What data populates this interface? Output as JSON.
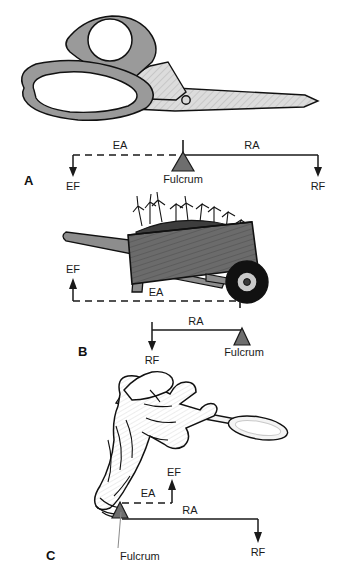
{
  "figure": {
    "background_color": "#ffffff",
    "ink_color": "#1a1a1a",
    "fulcrum_fill": "#6e6e6e",
    "handle_gray": "#9a9a9a",
    "blade_gray": "#d8d8d8",
    "tray_gray": "#6b6b6b",
    "wheel_black": "#111111"
  },
  "panels": [
    {
      "id": "panel-a",
      "letter": "A",
      "illustration": "scissors",
      "labels": {
        "effort_arm": "EA",
        "resistance_arm": "RA",
        "fulcrum": "Fulcrum",
        "effort_force": "EF",
        "resistance_force": "RF"
      }
    },
    {
      "id": "panel-b",
      "letter": "B",
      "illustration": "wheelbarrow",
      "labels": {
        "effort_arm": "EA",
        "resistance_arm": "RA",
        "fulcrum": "Fulcrum",
        "effort_force": "EF",
        "resistance_force": "RF"
      }
    },
    {
      "id": "panel-c",
      "letter": "C",
      "illustration": "hand-holding-spoon",
      "labels": {
        "effort_arm": "EA",
        "resistance_arm": "RA",
        "fulcrum": "Fulcrum",
        "effort_force": "EF",
        "resistance_force": "RF"
      }
    }
  ]
}
